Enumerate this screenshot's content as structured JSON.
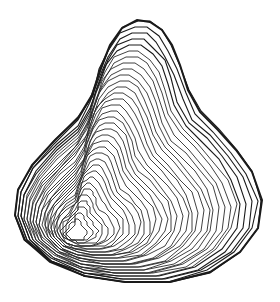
{
  "image": {
    "description": "Line-contour rendering of a pear-shaped 3D surface",
    "subject": "pear-shaped contour surface",
    "colors": {
      "background": "#ffffff",
      "contour_line": "#2b2b2b",
      "dense_edge": "#1a1a1a"
    },
    "contour_count": 34
  }
}
